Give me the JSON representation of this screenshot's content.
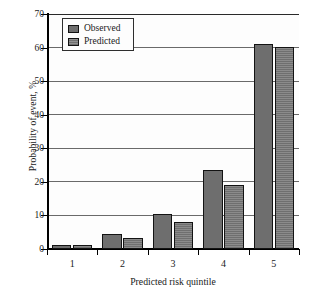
{
  "chart_data": {
    "type": "bar",
    "title": "",
    "xlabel": "Predicted risk quintile",
    "ylabel": "Probability of event, %",
    "categories": [
      "1",
      "2",
      "3",
      "4",
      "5"
    ],
    "series": [
      {
        "name": "Observed",
        "values": [
          1.2,
          4.6,
          10.4,
          23.6,
          61.0
        ]
      },
      {
        "name": "Predicted",
        "values": [
          1.2,
          3.3,
          8.0,
          19.2,
          60.2
        ]
      }
    ],
    "ylim": [
      0,
      70
    ],
    "yticks": [
      0,
      10,
      20,
      30,
      40,
      50,
      60,
      70
    ],
    "ytick_labels": [
      "0",
      "10",
      "20",
      "30",
      "40",
      "50",
      "60",
      "70"
    ],
    "grid": true,
    "legend_position": "upper-left",
    "colors": {
      "observed": "#6e6e6e",
      "predicted": "#757575",
      "bar_outline": "#131313",
      "gridline": "#6a6a6a",
      "axis": "#000000",
      "background": "#ffffff"
    }
  },
  "legend": {
    "items": [
      {
        "label": "Observed"
      },
      {
        "label": "Predicted"
      }
    ]
  }
}
